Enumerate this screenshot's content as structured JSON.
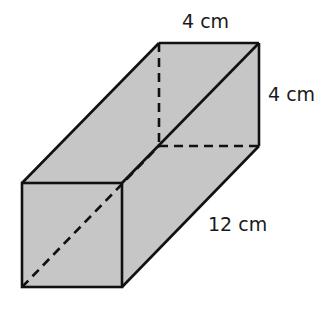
{
  "figure": {
    "type": "rectangular prism",
    "fill_color": "#c6c6c6",
    "stroke_color": "#111111",
    "labels": {
      "top_width": "4 cm",
      "right_height": "4 cm",
      "length": "12 cm"
    },
    "vertices": {
      "front_top_left": [
        22,
        183
      ],
      "front_top_right": [
        122,
        183
      ],
      "front_bottom_right": [
        122,
        287
      ],
      "front_bottom_left": [
        22,
        287
      ],
      "back_top_left": [
        159,
        43
      ],
      "back_top_right": [
        259,
        43
      ],
      "back_bottom_right": [
        259,
        146
      ],
      "back_bottom_left_hidden": [
        159,
        146
      ]
    }
  }
}
